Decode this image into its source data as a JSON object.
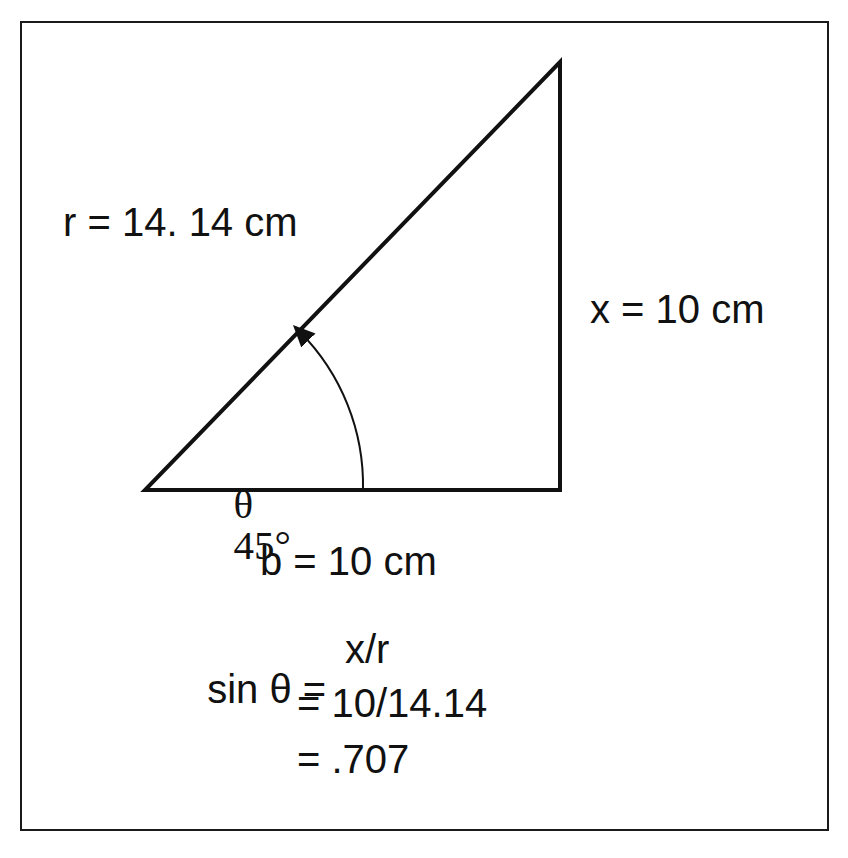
{
  "diagram": {
    "type": "right-triangle",
    "labels": {
      "hypotenuse": "r = 14. 14 cm",
      "opposite": "x = 10 cm",
      "adjacent": "b = 10 cm",
      "angle_symbol": "θ",
      "angle_value": "45°"
    },
    "equations": {
      "line1_lhs": "sin θ =",
      "line1_rhs": "x/r",
      "line2": "= 10/14.14",
      "line3": "= .707"
    },
    "geometry": {
      "vertex_angle": [
        145,
        490
      ],
      "vertex_right": [
        560,
        490
      ],
      "vertex_top": [
        560,
        62
      ]
    },
    "colors": {
      "stroke": "#111111",
      "background": "#ffffff"
    }
  }
}
